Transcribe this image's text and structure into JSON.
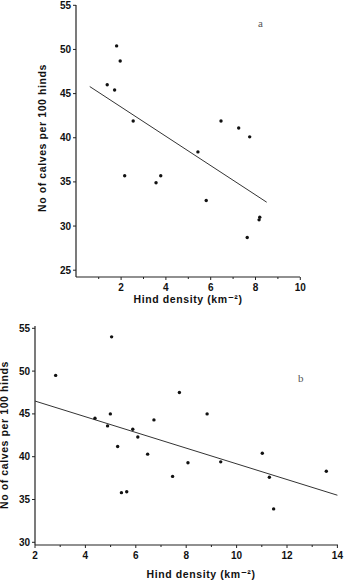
{
  "chart_data": [
    {
      "type": "scatter",
      "panel_label": "a",
      "title": "",
      "xlabel": "Hind density (km⁻²)",
      "ylabel": "No of calves per 100 hinds",
      "xlim": [
        0,
        10
      ],
      "ylim": [
        25,
        55
      ],
      "x_ticks": [
        2,
        4,
        6,
        8,
        10
      ],
      "y_ticks": [
        25,
        30,
        35,
        40,
        45,
        50,
        55
      ],
      "grid": false,
      "points": [
        [
          1.38,
          46.0
        ],
        [
          1.71,
          45.4
        ],
        [
          1.8,
          50.4
        ],
        [
          1.96,
          48.7
        ],
        [
          2.16,
          35.7
        ],
        [
          2.54,
          41.9
        ],
        [
          3.56,
          34.9
        ],
        [
          3.77,
          35.7
        ],
        [
          5.43,
          38.4
        ],
        [
          5.8,
          32.9
        ],
        [
          6.46,
          41.9
        ],
        [
          7.25,
          41.1
        ],
        [
          7.63,
          28.7
        ],
        [
          7.74,
          40.1
        ],
        [
          8.16,
          30.7
        ],
        [
          8.19,
          31.0
        ]
      ],
      "regression_line": [
        [
          0.6,
          45.8
        ],
        [
          8.5,
          32.7
        ]
      ]
    },
    {
      "type": "scatter",
      "panel_label": "b",
      "title": "",
      "xlabel": "Hind density (km⁻²)",
      "ylabel": "No of calves per 100 hinds",
      "xlim": [
        2,
        14
      ],
      "ylim": [
        30,
        55
      ],
      "x_ticks": [
        2,
        4,
        6,
        8,
        10,
        12,
        14
      ],
      "y_ticks": [
        30,
        35,
        40,
        45,
        50,
        55
      ],
      "grid": false,
      "points": [
        [
          2.82,
          49.5
        ],
        [
          4.38,
          44.5
        ],
        [
          4.88,
          43.6
        ],
        [
          4.99,
          45.0
        ],
        [
          5.04,
          54.0
        ],
        [
          5.28,
          41.2
        ],
        [
          5.43,
          35.8
        ],
        [
          5.64,
          35.9
        ],
        [
          5.88,
          43.2
        ],
        [
          6.08,
          42.3
        ],
        [
          6.47,
          40.3
        ],
        [
          6.72,
          44.3
        ],
        [
          7.46,
          37.7
        ],
        [
          7.73,
          47.5
        ],
        [
          8.07,
          39.3
        ],
        [
          8.83,
          45.0
        ],
        [
          9.37,
          39.4
        ],
        [
          11.02,
          40.4
        ],
        [
          11.3,
          37.6
        ],
        [
          11.47,
          33.9
        ],
        [
          13.56,
          38.3
        ]
      ],
      "regression_line": [
        [
          2.0,
          46.5
        ],
        [
          14.0,
          35.5
        ]
      ]
    }
  ],
  "layout": [
    {
      "x0_px": 76.3,
      "px_per_x": 22.4,
      "y_top_val": 55,
      "y_top_px": 5.3,
      "px_per_y": 8.83,
      "axis_left": 76,
      "axis_top": 5,
      "axis_bottom": 277,
      "axis_right": 300,
      "minor_x_ticks": [
        1,
        3,
        5,
        7,
        9
      ],
      "ylabel_x": 46,
      "ylabel_y": 138,
      "xlabel_x": 188,
      "xlabel_y": 303,
      "panel_label_x": 258,
      "panel_label_y": 27
    },
    {
      "x0_px": -15.4,
      "px_per_x": 25.2,
      "y_top_val": 55,
      "y_top_px": 328.3,
      "px_per_y": 8.56,
      "axis_left": 35,
      "axis_top": 326,
      "axis_bottom": 545,
      "axis_right": 338,
      "minor_x_ticks": [
        3,
        5,
        7,
        9,
        11,
        13
      ],
      "ylabel_x": 8,
      "ylabel_y": 435,
      "xlabel_x": 201,
      "xlabel_y": 578,
      "panel_label_x": 298,
      "panel_label_y": 382
    }
  ]
}
